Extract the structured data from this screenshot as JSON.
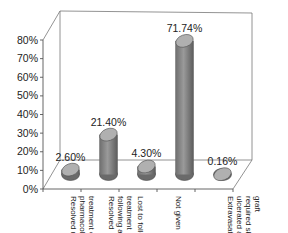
{
  "chart_data": {
    "type": "bar",
    "style": "3d-cylinder",
    "title": "",
    "xlabel": "",
    "ylabel": "",
    "ylim": [
      0,
      80
    ],
    "yticks": [
      "0%",
      "10%",
      "20%",
      "30%",
      "40%",
      "50%",
      "60%",
      "70%",
      "80%"
    ],
    "categories": [
      "Resolved using pharmacological treatment only",
      "Resolved following acute treatment",
      "Lost to follow-up",
      "Not given",
      "Extravasation ulcerated and required skin graft"
    ],
    "category_lines": [
      [
        "Resolved using",
        "pharmacological",
        "treatment only"
      ],
      [
        "Resolved",
        "following acute",
        "treatment"
      ],
      [
        "Lost to follow-up"
      ],
      [
        "Not given"
      ],
      [
        "Extravasation",
        "ulcerated and",
        "required skin",
        "graft"
      ]
    ],
    "values": [
      2.6,
      21.4,
      4.3,
      71.74,
      0.16
    ],
    "data_labels": [
      "2.60%",
      "21.40%",
      "4.30%",
      "71.74%",
      "0.16%"
    ],
    "grid": false,
    "legend": null,
    "colors": {
      "bar": "#8a8a8a",
      "bar_top": "#b0b0b0",
      "axis": "#666666"
    }
  }
}
